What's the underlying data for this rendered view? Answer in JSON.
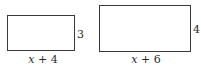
{
  "figures": [
    {
      "id": "rect-small",
      "width_label_var": "x",
      "width_label_rest": " + 4",
      "height_label": "3"
    },
    {
      "id": "rect-large",
      "width_label_var": "x",
      "width_label_rest": " + 6",
      "height_label": "4"
    }
  ]
}
